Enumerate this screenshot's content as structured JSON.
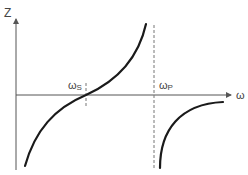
{
  "diagram": {
    "type": "reactance-vs-frequency",
    "y_axis": {
      "label": "Z"
    },
    "x_axis": {
      "label": "ω"
    },
    "markers": [
      {
        "id": "series_resonance",
        "symbol": "ω",
        "subscript": "S"
      },
      {
        "id": "parallel_resonance",
        "symbol": "ω",
        "subscript": "P"
      }
    ],
    "curves": [
      {
        "id": "branch_below_wp",
        "description": "rises from negative through zero at ωS toward +∞ at ωP"
      },
      {
        "id": "branch_above_wp",
        "description": "rises from −∞ just above ωP, approaching zero from below"
      }
    ],
    "colors": {
      "axis": "#555555",
      "curve": "#1a1a1a",
      "dashed_marker": "#777777",
      "background": "#ffffff"
    }
  }
}
